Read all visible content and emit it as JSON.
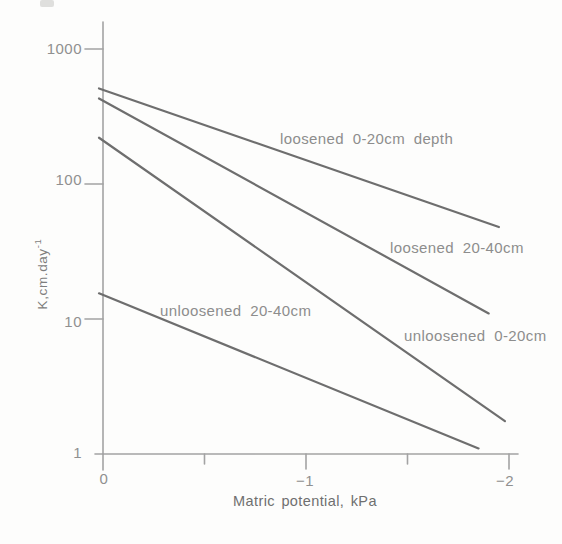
{
  "figure": {
    "background": "#fdfdfc",
    "line_color": "#6e6e6e",
    "axis_color": "#a3a3a3",
    "label_color": "#8d8d8d"
  },
  "chart_data": {
    "type": "line",
    "title": "",
    "xlabel": "Matric potential, kPa",
    "ylabel": "K,cm.day⁻¹",
    "ylabel_base": "K,cm.day",
    "ylabel_sup": "-1",
    "x_axis": {
      "min": 0,
      "max": -2,
      "ticks": [
        {
          "value": 0,
          "label": "0"
        },
        {
          "value": -0.5,
          "label": ""
        },
        {
          "value": -1,
          "label": "−1"
        },
        {
          "value": -1.5,
          "label": ""
        },
        {
          "value": -2,
          "label": "−2"
        }
      ]
    },
    "y_axis": {
      "scale": "log",
      "min": 1,
      "max": 1000,
      "ticks": [
        {
          "value": 1000,
          "label": "1000"
        },
        {
          "value": 100,
          "label": "100"
        },
        {
          "value": 10,
          "label": "10"
        },
        {
          "value": 1,
          "label": "1"
        }
      ]
    },
    "series": [
      {
        "name": "loosened 0-20cm depth",
        "points": [
          [
            0,
            510
          ],
          [
            -1.95,
            48
          ]
        ]
      },
      {
        "name": "loosened 20-40cm",
        "points": [
          [
            0,
            430
          ],
          [
            -1.9,
            11
          ]
        ]
      },
      {
        "name": "unloosened 0-20cm",
        "points": [
          [
            0,
            220
          ],
          [
            -1.98,
            1.75
          ]
        ]
      },
      {
        "name": "unloosened 20-40cm",
        "points": [
          [
            0,
            15.5
          ],
          [
            -1.85,
            1.1
          ]
        ]
      }
    ],
    "legend": "inline-labels",
    "grid": false
  }
}
